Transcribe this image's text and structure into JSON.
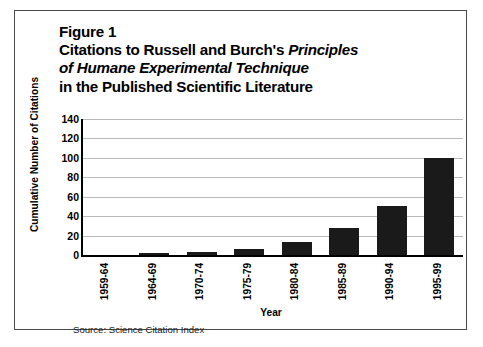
{
  "figure": {
    "label": "Figure 1",
    "title_lines": [
      "Figure 1",
      "Citations to Russell and Burch's Principles",
      "of Humane Experimental Technique",
      "in the Published Scientific Literature"
    ],
    "title_line2_plain": "Citations to Russell and Burch's ",
    "title_line2_italic": "Principles",
    "title_line3_italic": "of Humane Experimental Technique",
    "title_line4_plain": "in the Published Scientific Literature",
    "source": "Source: Science Citation Index",
    "border_color": "#4a4a4a"
  },
  "chart_data": {
    "type": "bar",
    "title": "Citations to Russell and Burch's Principles of Humane Experimental Technique in the Published Scientific Literature",
    "xlabel": "Year",
    "ylabel": "Cumulative Number of Citations",
    "categories": [
      "1959-64",
      "1964-69",
      "1970-74",
      "1975-79",
      "1980-84",
      "1985-89",
      "1990-94",
      "1995-99"
    ],
    "values": [
      0,
      2,
      3,
      6,
      13,
      28,
      50,
      100
    ],
    "ylim": [
      0,
      140
    ],
    "yticks": [
      0,
      20,
      40,
      60,
      80,
      100,
      120,
      140
    ],
    "ytick_labels": [
      "0",
      "20",
      "40",
      "60",
      "80",
      "100",
      "120",
      "140"
    ],
    "grid": true,
    "grid_axis": "y",
    "legend": false,
    "bar_color": "#1a1a1a",
    "grid_color": "#b9b9b9",
    "axis_color": "#000000"
  }
}
